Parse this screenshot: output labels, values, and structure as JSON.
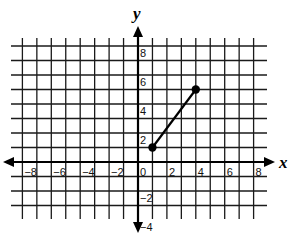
{
  "chart_data": {
    "type": "line",
    "title": "",
    "xlabel": "x",
    "ylabel": "y",
    "xlim": [
      -8,
      8
    ],
    "ylim": [
      -4,
      8
    ],
    "grid": true,
    "grid_step": 1,
    "x_tick_labels": [
      "-8",
      "-6",
      "-4",
      "-2",
      "0",
      "2",
      "4",
      "6",
      "8"
    ],
    "x_ticks": [
      -8,
      -6,
      -4,
      -2,
      0,
      2,
      4,
      6,
      8
    ],
    "y_tick_labels": [
      "8",
      "6",
      "4",
      "2",
      "-2",
      "-4"
    ],
    "y_ticks": [
      8,
      6,
      4,
      2,
      -2,
      -4
    ],
    "series": [
      {
        "name": "segment",
        "points": [
          [
            1,
            1
          ],
          [
            4,
            5
          ]
        ],
        "endpoints": "closed",
        "color": "#000000"
      }
    ],
    "legend": null
  },
  "style": {
    "grid_color": "#1a1a1a",
    "axis_color": "#000000",
    "background": "#ffffff"
  }
}
